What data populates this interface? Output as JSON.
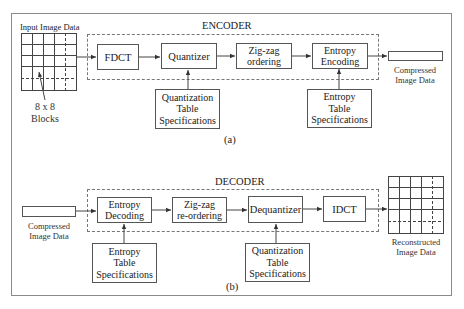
{
  "encoder": {
    "title": "ENCODER",
    "input_label": "Input Image Data",
    "blocks_label_line1": "8 x 8",
    "blocks_label_line2": "Blocks",
    "stages": [
      {
        "id": "fdct",
        "label": "FDCT"
      },
      {
        "id": "quantizer",
        "label": "Quantizer"
      },
      {
        "id": "zigzag",
        "label_line1": "Zig-zag",
        "label_line2": "ordering"
      },
      {
        "id": "entropy-encoding",
        "label_line1": "Entropy",
        "label_line2": "Encoding"
      }
    ],
    "specs": [
      {
        "id": "quantization-table",
        "line1": "Quantization",
        "line2": "Table",
        "line3": "Specifications"
      },
      {
        "id": "entropy-table",
        "line1": "Entropy",
        "line2": "Table",
        "line3": "Specifications"
      }
    ],
    "output_label_line1": "Compressed",
    "output_label_line2": "Image Data",
    "caption": "(a)"
  },
  "decoder": {
    "title": "DECODER",
    "input_label_line1": "Compressed",
    "input_label_line2": "Image Data",
    "stages": [
      {
        "id": "entropy-decoding",
        "label_line1": "Entropy",
        "label_line2": "Decoding"
      },
      {
        "id": "zigzag-reordering",
        "label_line1": "Zig-zag",
        "label_line2": "re-ordering"
      },
      {
        "id": "dequantizer",
        "label": "Dequantizer"
      },
      {
        "id": "idct",
        "label": "IDCT"
      }
    ],
    "specs": [
      {
        "id": "entropy-table",
        "line1": "Entropy",
        "line2": "Table",
        "line3": "Specifications"
      },
      {
        "id": "quantization-table",
        "line1": "Quantization",
        "line2": "Table",
        "line3": "Specifications"
      }
    ],
    "output_label_line1": "Reconstructed",
    "output_label_line2": "Image Data",
    "caption": "(b)"
  }
}
